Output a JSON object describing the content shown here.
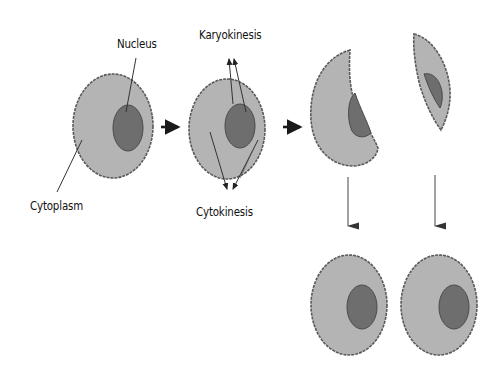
{
  "diagram": {
    "type": "biology-process",
    "colors": {
      "cytoplasm": "#b4b4b4",
      "nucleus": "#6e6e6e",
      "outline": "#555555",
      "arrow": "#1a1a1a",
      "background": "#ffffff"
    },
    "labels": {
      "nucleus": "Nucleus",
      "cytoplasm": "Cytoplasm",
      "karyokinesis": "Karyokinesis",
      "cytokinesis": "Cytokinesis"
    },
    "stages": [
      {
        "id": "parent-cell",
        "description": "Single cell with cytoplasm and nucleus"
      },
      {
        "id": "dividing-cell",
        "description": "Karyokinesis and cytokinesis begin"
      },
      {
        "id": "split-halves",
        "description": "Cell separates into two parts"
      },
      {
        "id": "daughter-cells",
        "description": "Two daughter cells, each with nucleus"
      }
    ]
  }
}
